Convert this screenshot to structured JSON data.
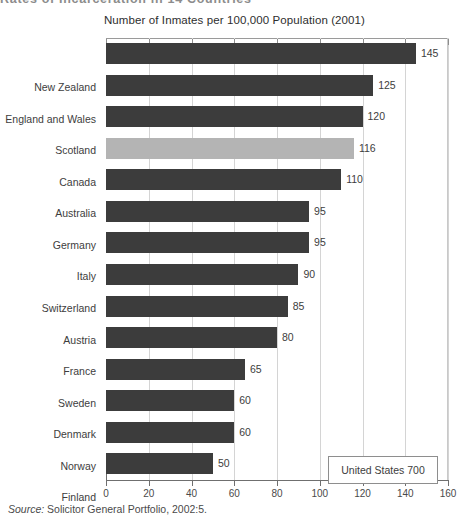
{
  "page_heading": "Rates of Incarceration in 14 Countries",
  "source_note": {
    "label": "Source:",
    "text": "Solicitor General Portfolio, 2002:5."
  },
  "callout": {
    "text": "United States 700"
  },
  "chart_data": {
    "type": "bar",
    "orientation": "horizontal",
    "title": "Number of Inmates per 100,000 Population (2001)",
    "xlabel": "",
    "ylabel": "",
    "xlim": [
      0,
      160
    ],
    "xticks": [
      "0",
      "20",
      "40",
      "60",
      "80",
      "100",
      "120",
      "140",
      "160"
    ],
    "grid": "vertical",
    "legend": "none",
    "categories": [
      "New Zealand",
      "England and Wales",
      "Scotland",
      "Canada",
      "Australia",
      "Germany",
      "Italy",
      "Switzerland",
      "Austria",
      "France",
      "Sweden",
      "Denmark",
      "Norway",
      "Finland"
    ],
    "values": [
      145,
      125,
      120,
      116,
      110,
      95,
      95,
      90,
      85,
      80,
      65,
      60,
      60,
      50
    ],
    "value_labels": [
      "145",
      "125",
      "120",
      "116",
      "110",
      "95",
      "95",
      "90",
      "85",
      "80",
      "65",
      "60",
      "60",
      "50"
    ],
    "highlight_category": "Canada",
    "colors": {
      "bar": "#3c3c3c",
      "highlight": "#b4b4b4",
      "grid": "#d4d4d4",
      "axis": "#6f6f6f"
    },
    "annotations": [
      {
        "text": "United States 700",
        "value": 700
      }
    ]
  }
}
